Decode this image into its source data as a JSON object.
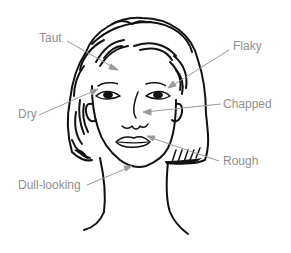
{
  "diagram": {
    "line_color": "#111111",
    "callout_color": "#9a9a9a",
    "labels": [
      {
        "id": "taut",
        "text": "Taut"
      },
      {
        "id": "flaky",
        "text": "Flaky"
      },
      {
        "id": "dry",
        "text": "Dry"
      },
      {
        "id": "chapped",
        "text": "Chapped"
      },
      {
        "id": "rough",
        "text": "Rough"
      },
      {
        "id": "dull",
        "text": "Dull-looking"
      }
    ]
  }
}
